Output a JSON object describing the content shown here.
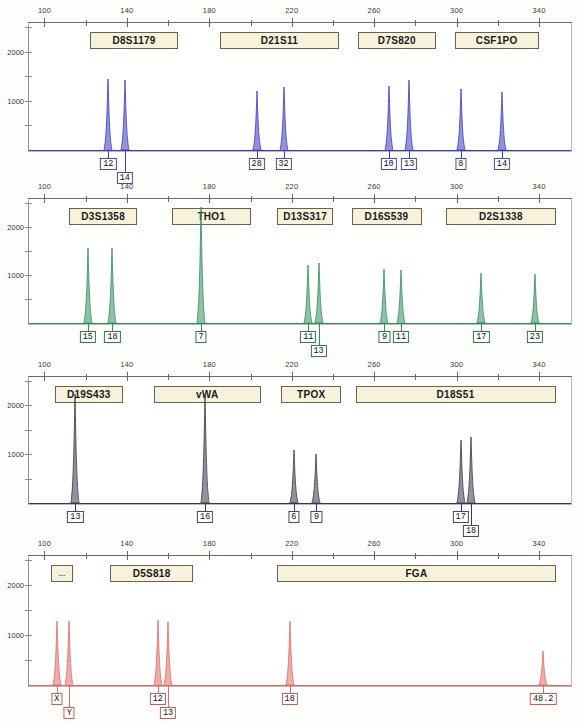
{
  "figure": {
    "type": "str-electropherogram",
    "title": "",
    "size_axis": {
      "unit": "bp",
      "ticks_major": [
        100,
        140,
        180,
        220,
        260,
        300,
        340
      ],
      "tick_labels": [
        "100",
        "140",
        "180",
        "220",
        "260",
        "300",
        "340"
      ],
      "range": [
        92,
        356
      ]
    },
    "rfu_axis": {
      "unit": "RFU",
      "tick_labels": [
        "2000",
        "1000"
      ],
      "tick_values": [
        2000,
        1000
      ],
      "max": 2600
    }
  },
  "chart_data": {
    "type": "line",
    "xlabel": "Fragment size (bp)",
    "ylabel": "RFU",
    "xlim": [
      92,
      356
    ],
    "ylim": [
      0,
      2600
    ],
    "grid": false,
    "legend": "none",
    "panels": [
      {
        "index": 1,
        "dye_color": "#3b3bbf",
        "markers": [
          {
            "name": "D8S1179",
            "start_bp": 122,
            "end_bp": 165
          },
          {
            "name": "D21S11",
            "start_bp": 185,
            "end_bp": 243
          },
          {
            "name": "D7S820",
            "start_bp": 252,
            "end_bp": 290
          },
          {
            "name": "CSF1PO",
            "start_bp": 299,
            "end_bp": 340
          }
        ],
        "peaks": [
          {
            "allele": "12",
            "bp": 131,
            "rfu": 1450,
            "marker": "D8S1179"
          },
          {
            "allele": "14",
            "bp": 139,
            "rfu": 1420,
            "marker": "D8S1179"
          },
          {
            "allele": "28",
            "bp": 203,
            "rfu": 1200,
            "marker": "D21S11"
          },
          {
            "allele": "32",
            "bp": 216,
            "rfu": 1290,
            "marker": "D21S11"
          },
          {
            "allele": "10",
            "bp": 267,
            "rfu": 1310,
            "marker": "D7S820"
          },
          {
            "allele": "13",
            "bp": 277,
            "rfu": 1430,
            "marker": "D7S820"
          },
          {
            "allele": "8",
            "bp": 302,
            "rfu": 1240,
            "marker": "CSF1PO"
          },
          {
            "allele": "14",
            "bp": 322,
            "rfu": 1180,
            "marker": "CSF1PO"
          }
        ]
      },
      {
        "index": 2,
        "dye_color": "#2f8f5b",
        "markers": [
          {
            "name": "D3S1358",
            "start_bp": 112,
            "end_bp": 145
          },
          {
            "name": "THO1",
            "start_bp": 162,
            "end_bp": 200
          },
          {
            "name": "D13S317",
            "start_bp": 213,
            "end_bp": 240
          },
          {
            "name": "D16S539",
            "start_bp": 249,
            "end_bp": 283
          },
          {
            "name": "D2S1338",
            "start_bp": 295,
            "end_bp": 348
          }
        ],
        "peaks": [
          {
            "allele": "15",
            "bp": 121,
            "rfu": 1560,
            "marker": "D3S1358"
          },
          {
            "allele": "18",
            "bp": 133,
            "rfu": 1560,
            "marker": "D3S1358"
          },
          {
            "allele": "7",
            "bp": 176,
            "rfu": 2420,
            "marker": "THO1"
          },
          {
            "allele": "11",
            "bp": 228,
            "rfu": 1210,
            "marker": "D13S317"
          },
          {
            "allele": "13",
            "bp": 233,
            "rfu": 1240,
            "marker": "D13S317"
          },
          {
            "allele": "9",
            "bp": 265,
            "rfu": 1130,
            "marker": "D16S539"
          },
          {
            "allele": "11",
            "bp": 273,
            "rfu": 1110,
            "marker": "D16S539"
          },
          {
            "allele": "17",
            "bp": 312,
            "rfu": 1030,
            "marker": "D2S1338"
          },
          {
            "allele": "23",
            "bp": 338,
            "rfu": 1020,
            "marker": "D2S1338"
          }
        ]
      },
      {
        "index": 3,
        "dye_color": "#3c3648",
        "markers": [
          {
            "name": "D19S433",
            "start_bp": 105,
            "end_bp": 138
          },
          {
            "name": "vWA",
            "start_bp": 153,
            "end_bp": 205
          },
          {
            "name": "TPOX",
            "start_bp": 215,
            "end_bp": 244
          },
          {
            "name": "D18S51",
            "start_bp": 251,
            "end_bp": 348
          }
        ],
        "peaks": [
          {
            "allele": "13",
            "bp": 115,
            "rfu": 2230,
            "marker": "D19S433"
          },
          {
            "allele": "16",
            "bp": 178,
            "rfu": 2230,
            "marker": "vWA"
          },
          {
            "allele": "6",
            "bp": 221,
            "rfu": 1080,
            "marker": "TPOX"
          },
          {
            "allele": "9",
            "bp": 232,
            "rfu": 1000,
            "marker": "TPOX"
          },
          {
            "allele": "17",
            "bp": 302,
            "rfu": 1290,
            "marker": "D18S51"
          },
          {
            "allele": "18",
            "bp": 307,
            "rfu": 1350,
            "marker": "D18S51"
          }
        ]
      },
      {
        "index": 4,
        "dye_color": "#e06a63",
        "markers": [
          {
            "name": "...",
            "start_bp": 103,
            "end_bp": 114
          },
          {
            "name": "D5S818",
            "start_bp": 132,
            "end_bp": 172
          },
          {
            "name": "FGA",
            "start_bp": 213,
            "end_bp": 348
          }
        ],
        "peaks": [
          {
            "allele": "X",
            "bp": 106,
            "rfu": 1280,
            "marker": "..."
          },
          {
            "allele": "Y",
            "bp": 112,
            "rfu": 1290,
            "marker": "..."
          },
          {
            "allele": "12",
            "bp": 155,
            "rfu": 1310,
            "marker": "D5S818"
          },
          {
            "allele": "13",
            "bp": 160,
            "rfu": 1270,
            "marker": "D5S818"
          },
          {
            "allele": "18",
            "bp": 219,
            "rfu": 1280,
            "marker": "FGA"
          },
          {
            "allele": "48.2",
            "bp": 342,
            "rfu": 680,
            "marker": "FGA"
          }
        ]
      }
    ]
  }
}
